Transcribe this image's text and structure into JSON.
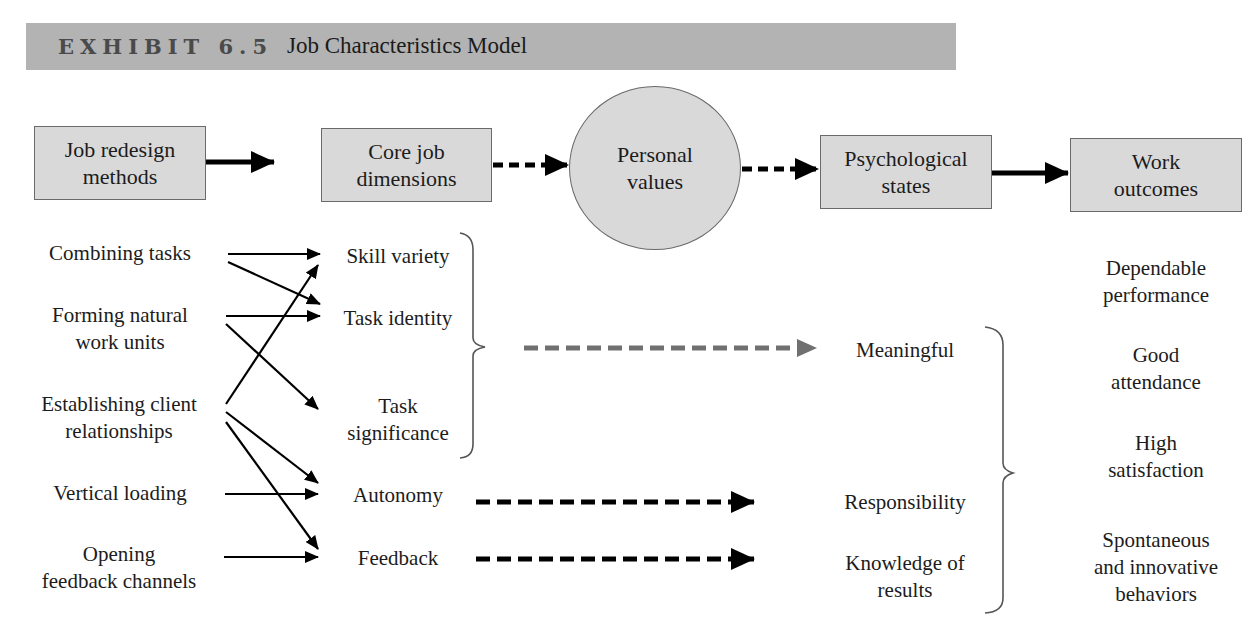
{
  "header": {
    "exhibit": "EXHIBIT 6.5",
    "title": "Job Characteristics Model"
  },
  "colors": {
    "header_bar": "#b3b3b3",
    "box_fill": "#d9d9d9",
    "box_border": "#6a6a6a",
    "arrow": "#000000",
    "meaningful_arrow": "#707070"
  },
  "top_flow": {
    "nodes": [
      {
        "id": "job_redesign",
        "line1": "Job redesign",
        "line2": "methods",
        "shape": "box"
      },
      {
        "id": "core_job",
        "line1": "Core job",
        "line2": "dimensions",
        "shape": "box"
      },
      {
        "id": "personal_values",
        "line1": "Personal",
        "line2": "values",
        "shape": "ellipse"
      },
      {
        "id": "psych_states",
        "line1": "Psychological",
        "line2": "states",
        "shape": "box"
      },
      {
        "id": "work_outcomes",
        "line1": "Work",
        "line2": "outcomes",
        "shape": "box"
      }
    ],
    "edges": [
      {
        "from": "job_redesign",
        "to": "core_job",
        "style": "solid"
      },
      {
        "from": "core_job",
        "to": "personal_values",
        "style": "dashed"
      },
      {
        "from": "personal_values",
        "to": "psych_states",
        "style": "dashed"
      },
      {
        "from": "psych_states",
        "to": "work_outcomes",
        "style": "solid"
      }
    ]
  },
  "methods": [
    {
      "line1": "Combining tasks",
      "line2": ""
    },
    {
      "line1": "Forming natural",
      "line2": "work units"
    },
    {
      "line1": "Establishing client",
      "line2": "relationships"
    },
    {
      "line1": "Vertical loading",
      "line2": ""
    },
    {
      "line1": "Opening",
      "line2": "feedback channels"
    }
  ],
  "dimensions": [
    {
      "line1": "Skill variety",
      "line2": ""
    },
    {
      "line1": "Task identity",
      "line2": ""
    },
    {
      "line1": "Task",
      "line2": "significance"
    },
    {
      "line1": "Autonomy",
      "line2": ""
    },
    {
      "line1": "Feedback",
      "line2": ""
    }
  ],
  "method_links": [
    {
      "from": "Combining tasks",
      "to": "Skill variety"
    },
    {
      "from": "Combining tasks",
      "to": "Task identity"
    },
    {
      "from": "Forming natural work units",
      "to": "Task identity"
    },
    {
      "from": "Forming natural work units",
      "to": "Task significance"
    },
    {
      "from": "Establishing client relationships",
      "to": "Skill variety"
    },
    {
      "from": "Establishing client relationships",
      "to": "Autonomy"
    },
    {
      "from": "Establishing client relationships",
      "to": "Feedback"
    },
    {
      "from": "Vertical loading",
      "to": "Autonomy"
    },
    {
      "from": "Opening feedback channels",
      "to": "Feedback"
    }
  ],
  "states": [
    {
      "line1": "Meaningful",
      "line2": ""
    },
    {
      "line1": "Responsibility",
      "line2": ""
    },
    {
      "line1": "Knowledge of",
      "line2": "results"
    }
  ],
  "outcomes": [
    {
      "line1": "Dependable",
      "line2": "performance"
    },
    {
      "line1": "Good",
      "line2": "attendance"
    },
    {
      "line1": "High",
      "line2": "satisfaction"
    },
    {
      "line1": "Spontaneous",
      "line2": "and innovative",
      "line3": "behaviors"
    }
  ]
}
